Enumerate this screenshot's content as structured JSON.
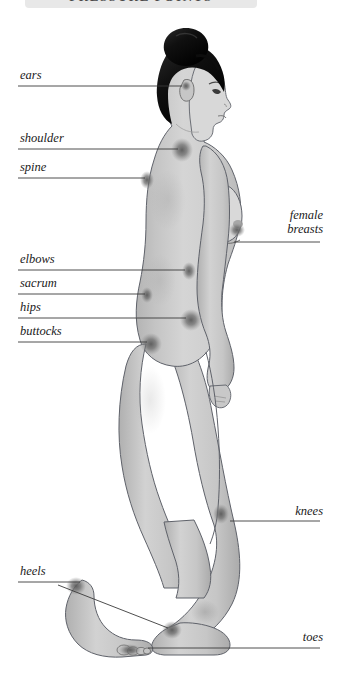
{
  "banner": {
    "title": "PRESSURE POINTS",
    "background": "#e8e8e8",
    "text_color": "#4a4a4a"
  },
  "illustration": {
    "name": "female-figure-side-profile",
    "description": "Grayscale side view of a standing woman walking, facing right, with dark shaded marks at body pressure points",
    "skin_color": "#c9c9c9",
    "outline_color": "#5a5a62",
    "hair_color": "#111111",
    "point_color": "#6f6f6f"
  },
  "labels": {
    "left": [
      {
        "id": "ears",
        "text": "ears",
        "x": 20,
        "y": 68,
        "line_y": 86,
        "line_x1": 18,
        "line_x2": 182
      },
      {
        "id": "shoulder",
        "text": "shoulder",
        "x": 20,
        "y": 131,
        "line_y": 149,
        "line_x1": 18,
        "line_x2": 178
      },
      {
        "id": "spine",
        "text": "spine",
        "x": 20,
        "y": 160,
        "line_y": 178,
        "line_x1": 18,
        "line_x2": 145
      },
      {
        "id": "elbows",
        "text": "elbows",
        "x": 20,
        "y": 252,
        "line_y": 270,
        "line_x1": 18,
        "line_x2": 185
      },
      {
        "id": "sacrum",
        "text": "sacrum",
        "x": 20,
        "y": 276,
        "line_y": 294,
        "line_x1": 18,
        "line_x2": 145
      },
      {
        "id": "hips",
        "text": "hips",
        "x": 20,
        "y": 300,
        "line_y": 318,
        "line_x1": 18,
        "line_x2": 186
      },
      {
        "id": "buttocks",
        "text": "buttocks",
        "x": 20,
        "y": 324,
        "line_y": 342,
        "line_x1": 18,
        "line_x2": 147
      },
      {
        "id": "heels",
        "text": "heels",
        "x": 20,
        "y": 564,
        "line_y": 582,
        "line_x1": 18,
        "line_x2": 80
      }
    ],
    "right": [
      {
        "id": "female-breasts",
        "text_line_1": "female",
        "text_line_2": "breasts",
        "x": 276,
        "y": 208,
        "line_y": 242,
        "line_x1": 234,
        "line_x2": 320
      },
      {
        "id": "knees",
        "text_line_1": "knees",
        "text_line_2": "",
        "x": 281,
        "y": 504,
        "line_y": 521,
        "line_x1": 230,
        "line_x2": 320
      },
      {
        "id": "toes",
        "text_line_1": "toes",
        "text_line_2": "",
        "x": 289,
        "y": 630,
        "line_y": 648,
        "line_x1": 148,
        "line_x2": 320
      }
    ],
    "pointer_lines": [
      {
        "id": "heels-pointer",
        "x1": 58,
        "y1": 585,
        "x2": 168,
        "y2": 628
      }
    ]
  },
  "pressure_points": [
    {
      "name": "ear",
      "cx": 186,
      "cy": 86,
      "rx": 4,
      "ry": 5
    },
    {
      "name": "shoulder",
      "cx": 182,
      "cy": 150,
      "rx": 9,
      "ry": 10
    },
    {
      "name": "spine",
      "cx": 146,
      "cy": 180,
      "rx": 6,
      "ry": 8
    },
    {
      "name": "breast",
      "cx": 236,
      "cy": 232,
      "rx": 7,
      "ry": 6
    },
    {
      "name": "elbow",
      "cx": 188,
      "cy": 271,
      "rx": 6,
      "ry": 8
    },
    {
      "name": "sacrum",
      "cx": 146,
      "cy": 295,
      "rx": 5,
      "ry": 7
    },
    {
      "name": "hip",
      "cx": 190,
      "cy": 319,
      "rx": 9,
      "ry": 9
    },
    {
      "name": "buttock",
      "cx": 150,
      "cy": 343,
      "rx": 9,
      "ry": 9
    },
    {
      "name": "knee",
      "cx": 221,
      "cy": 514,
      "rx": 7,
      "ry": 9
    },
    {
      "name": "heel-front",
      "cx": 74,
      "cy": 586,
      "rx": 8,
      "ry": 7
    },
    {
      "name": "heel-rear",
      "cx": 170,
      "cy": 629,
      "rx": 8,
      "ry": 7
    },
    {
      "name": "toes",
      "cx": 128,
      "cy": 650,
      "rx": 10,
      "ry": 5
    }
  ]
}
